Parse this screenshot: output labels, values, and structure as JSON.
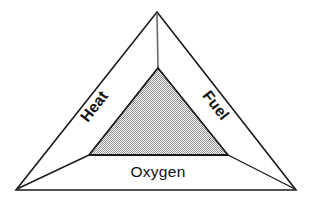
{
  "diagram": {
    "name": "fire-triangle",
    "background_color": "#ffffff",
    "outline_color": "#1a1a1a",
    "connector_color": "#555555",
    "inner_fill_color": "#c0c0c0",
    "inner_outline_color": "#1a1a1a",
    "text_color": "#111111",
    "labels": {
      "heat": "Heat",
      "fuel": "Fuel",
      "oxygen": "Oxygen"
    },
    "geometry": {
      "outer_apex": "157,12",
      "outer_bottom_left": "16,190",
      "outer_bottom_right": "296,190",
      "inner_apex": "158,68",
      "inner_bottom_left": "89,155",
      "inner_bottom_right": "228,155"
    },
    "label_rotation": {
      "heat_degrees": "-52",
      "fuel_degrees": "52",
      "oxygen_degrees": "0"
    }
  }
}
